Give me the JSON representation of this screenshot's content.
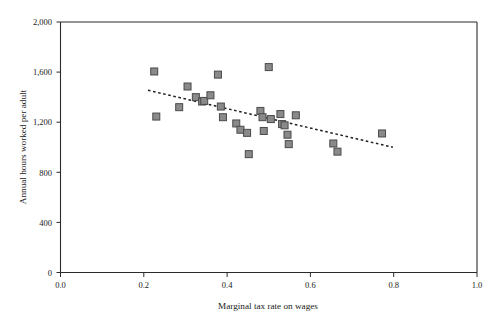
{
  "chart_data": {
    "type": "scatter",
    "title": "",
    "xlabel": "Marginal tax rate on wages",
    "ylabel": "Annual hours worked per adult",
    "xlim": [
      0.0,
      1.0
    ],
    "ylim": [
      0,
      2000
    ],
    "xticks": [
      0.0,
      0.2,
      0.4,
      0.6,
      0.8,
      1.0
    ],
    "xtick_labels": [
      "0.0",
      "0.2",
      "0.4",
      "0.6",
      "0.8",
      "1.0"
    ],
    "yticks": [
      0,
      400,
      800,
      1200,
      1600,
      2000
    ],
    "ytick_labels": [
      "0",
      "400",
      "800",
      "1,200",
      "1,600",
      "2,000"
    ],
    "grid": false,
    "legend": null,
    "marker": {
      "shape": "square",
      "fill_color": "#8a8a8a",
      "edge_color": "#4a4a4a",
      "size_px": 7
    },
    "points": [
      {
        "x": 0.225,
        "y": 1605
      },
      {
        "x": 0.23,
        "y": 1245
      },
      {
        "x": 0.285,
        "y": 1320
      },
      {
        "x": 0.305,
        "y": 1485
      },
      {
        "x": 0.325,
        "y": 1400
      },
      {
        "x": 0.34,
        "y": 1365
      },
      {
        "x": 0.345,
        "y": 1370
      },
      {
        "x": 0.36,
        "y": 1415
      },
      {
        "x": 0.378,
        "y": 1580
      },
      {
        "x": 0.385,
        "y": 1325
      },
      {
        "x": 0.39,
        "y": 1240
      },
      {
        "x": 0.422,
        "y": 1190
      },
      {
        "x": 0.432,
        "y": 1140
      },
      {
        "x": 0.448,
        "y": 1115
      },
      {
        "x": 0.452,
        "y": 945
      },
      {
        "x": 0.48,
        "y": 1290
      },
      {
        "x": 0.485,
        "y": 1240
      },
      {
        "x": 0.488,
        "y": 1130
      },
      {
        "x": 0.5,
        "y": 1640
      },
      {
        "x": 0.505,
        "y": 1225
      },
      {
        "x": 0.528,
        "y": 1265
      },
      {
        "x": 0.532,
        "y": 1185
      },
      {
        "x": 0.538,
        "y": 1175
      },
      {
        "x": 0.545,
        "y": 1100
      },
      {
        "x": 0.548,
        "y": 1025
      },
      {
        "x": 0.565,
        "y": 1255
      },
      {
        "x": 0.655,
        "y": 1030
      },
      {
        "x": 0.665,
        "y": 965
      },
      {
        "x": 0.772,
        "y": 1110
      }
    ],
    "trendline": {
      "style": "dotted",
      "x_start": 0.21,
      "y_start": 1455,
      "x_end": 0.798,
      "y_end": 1000
    }
  }
}
